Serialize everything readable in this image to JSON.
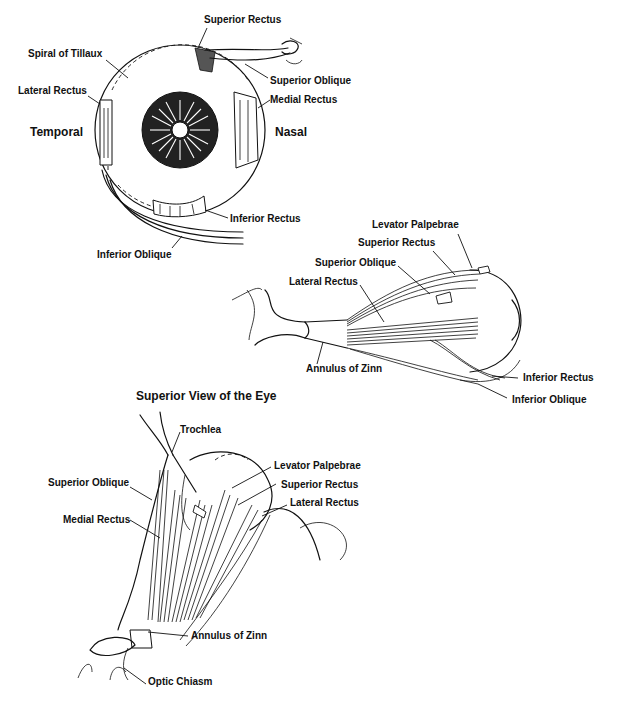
{
  "figure_a": {
    "name": "Anterior view",
    "labels": {
      "superior_rectus": "Superior Rectus",
      "spiral_of_tillaux": "Spiral of Tillaux",
      "superior_oblique": "Superior Oblique",
      "lateral_rectus": "Lateral Rectus",
      "medial_rectus": "Medial Rectus",
      "temporal": "Temporal",
      "nasal": "Nasal",
      "inferior_rectus": "Inferior Rectus",
      "inferior_oblique": "Inferior Oblique"
    }
  },
  "figure_b": {
    "name": "Lateral view",
    "labels": {
      "levator_palpebrae": "Levator Palpebrae",
      "superior_rectus": "Superior Rectus",
      "superior_oblique": "Superior Oblique",
      "lateral_rectus": "Lateral Rectus",
      "annulus_of_zinn": "Annulus of Zinn",
      "inferior_rectus": "Inferior Rectus",
      "inferior_oblique": "Inferior Oblique"
    }
  },
  "figure_c": {
    "title": "Superior View of the Eye",
    "labels": {
      "trochlea": "Trochlea",
      "superior_oblique": "Superior Oblique",
      "levator_palpebrae": "Levator Palpebrae",
      "superior_rectus": "Superior Rectus",
      "medial_rectus": "Medial Rectus",
      "lateral_rectus": "Lateral Rectus",
      "annulus_of_zinn": "Annulus of Zinn",
      "optic_chiasm": "Optic Chiasm"
    }
  }
}
